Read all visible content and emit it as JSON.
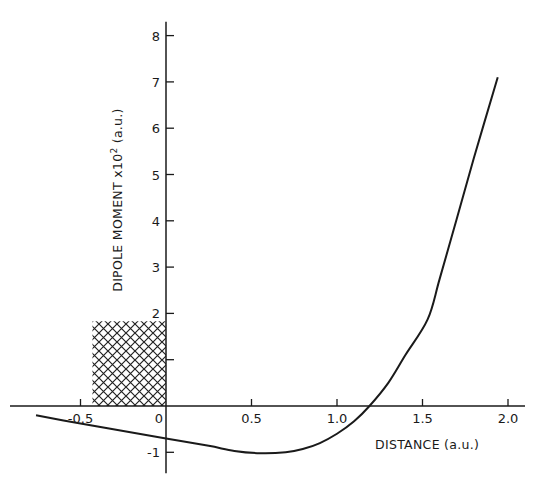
{
  "chart_data": {
    "type": "line",
    "title": "",
    "xlabel": "DISTANCE (a.u.)",
    "ylabel": "DIPOLE MOMENT x 10^2 (a.u.)",
    "ylabel_parts": {
      "main": "DIPOLE MOMENT x10",
      "exp": "2",
      "units": " (a.u.)"
    },
    "xlim": [
      -0.76,
      2.05
    ],
    "ylim": [
      -1.2,
      8.3
    ],
    "grid": false,
    "legend": null,
    "x_ticks": [
      -0.5,
      0,
      0.5,
      1.0,
      1.5,
      2.0
    ],
    "x_tick_labels": [
      "-0.5",
      "0",
      "0.5",
      "1.0",
      "1.5",
      "2.0"
    ],
    "y_ticks": [
      -1,
      1,
      2,
      3,
      4,
      5,
      6,
      7,
      8
    ],
    "y_tick_labels": [
      "-1",
      "",
      "2",
      "3",
      "4",
      "5",
      "6",
      "7",
      "8"
    ],
    "series": [
      {
        "name": "dipole moment",
        "x": [
          -0.76,
          -0.5,
          -0.25,
          0.0,
          0.25,
          0.4,
          0.55,
          0.7,
          0.8,
          0.9,
          1.0,
          1.1,
          1.19,
          1.3,
          1.4,
          1.53,
          1.6,
          1.7,
          1.8,
          1.94
        ],
        "y": [
          -0.2,
          -0.38,
          -0.54,
          -0.7,
          -0.86,
          -0.97,
          -1.02,
          -1.0,
          -0.93,
          -0.8,
          -0.6,
          -0.33,
          0.0,
          0.5,
          1.1,
          1.87,
          2.74,
          4.04,
          5.35,
          7.1
        ]
      }
    ],
    "annotations": [
      {
        "type": "hatched-region",
        "x0": -0.43,
        "x1": 0.0,
        "y0": 0.0,
        "y1": 1.83,
        "pattern": "crosshatch"
      }
    ]
  }
}
